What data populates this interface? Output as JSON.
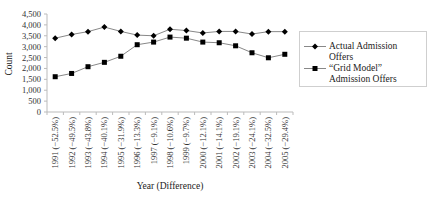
{
  "chart_data": {
    "type": "line",
    "title": "",
    "xlabel": "Year (Difference)",
    "ylabel": "Count",
    "ylim": [
      0,
      4500
    ],
    "yticks": [
      "0",
      "500",
      "1,000",
      "1,500",
      "2,000",
      "2,500",
      "3,000",
      "3,500",
      "4,000",
      "4,500"
    ],
    "ytick_values": [
      0,
      500,
      1000,
      1500,
      2000,
      2500,
      3000,
      3500,
      4000,
      4500
    ],
    "grid": false,
    "legend_position": "right",
    "categories": [
      "1991 (−52.5%)",
      "1992 (−49.5%)",
      "1993 (−43.8%)",
      "1994 (−40.1%)",
      "1995 (−31.9%)",
      "1996 (−13.3%)",
      "1997 (−9.1%)",
      "1998 (−10.6%)",
      "1999 (−9.7%)",
      "2000 (−12.1%)",
      "2001 (−14.1%)",
      "2002 (−19.1%)",
      "2003 (−24.1%)",
      "2004 (−32.5%)",
      "2005 (−29.4%)"
    ],
    "series": [
      {
        "name": "Actual Admission Offers",
        "marker": "diamond",
        "color": "#000000",
        "line_color": "#888888",
        "values": [
          3390,
          3560,
          3690,
          3900,
          3700,
          3530,
          3500,
          3800,
          3740,
          3630,
          3700,
          3700,
          3580,
          3690,
          3690
        ]
      },
      {
        "name": "“Grid Model” Admission Offers",
        "marker": "square",
        "color": "#000000",
        "line_color": "#888888",
        "values": [
          1620,
          1770,
          2080,
          2280,
          2560,
          3090,
          3210,
          3440,
          3390,
          3210,
          3180,
          3040,
          2720,
          2490,
          2650
        ]
      }
    ]
  },
  "legend": {
    "items": [
      {
        "label": "Actual Admission Offers",
        "marker": "diamond"
      },
      {
        "label": "“Grid Model” Admission Offers",
        "marker": "square"
      }
    ]
  }
}
